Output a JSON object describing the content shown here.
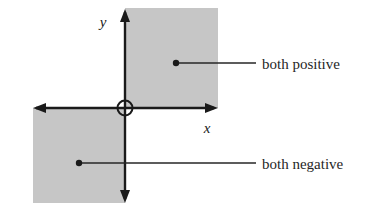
{
  "diagram": {
    "background_color": "#ffffff",
    "shade_color": "#c6c6c6",
    "line_color": "#1a1a1a",
    "text_color": "#262626",
    "axes": {
      "x_label": "x",
      "y_label": "y",
      "origin_marker": "open-circle",
      "x_axis": {
        "left_arrow": true,
        "right_arrow": true,
        "y": 108,
        "x_start": 33,
        "x_end": 218
      },
      "y_axis": {
        "up_arrow": true,
        "down_arrow": true,
        "x": 125,
        "y_start": 9,
        "y_end": 203
      }
    },
    "regions": [
      {
        "name": "quadrant-one-shade",
        "quadrant": "I",
        "x": 125,
        "y": 8,
        "width": 93,
        "height": 100
      },
      {
        "name": "quadrant-three-shade",
        "quadrant": "III",
        "x": 33,
        "y": 108,
        "width": 92,
        "height": 95
      }
    ],
    "callouts": [
      {
        "name": "both-positive",
        "label": "both positive",
        "dot": {
          "x": 176,
          "y": 63
        },
        "leader_end_x": 256,
        "text_x": 262,
        "text_y": 69
      },
      {
        "name": "both-negative",
        "label": "both negative",
        "dot": {
          "x": 79,
          "y": 163
        },
        "leader_end_x": 256,
        "text_x": 262,
        "text_y": 169
      }
    ]
  }
}
